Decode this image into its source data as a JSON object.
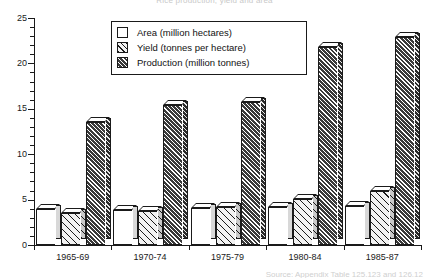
{
  "chart_data": {
    "type": "bar",
    "title": "Rice production, yield and area",
    "categories": [
      "1965-69",
      "1970-74",
      "1975-79",
      "1980-84",
      "1985-87"
    ],
    "series": [
      {
        "name": "Area (million hectares)",
        "values": [
          4.0,
          3.9,
          4.1,
          4.2,
          4.3
        ]
      },
      {
        "name": "Yield (tonnes per hectare)",
        "values": [
          3.5,
          3.8,
          4.2,
          5.1,
          5.9
        ]
      },
      {
        "name": "Production (million tonnes)",
        "values": [
          13.5,
          15.4,
          15.7,
          21.8,
          22.9
        ]
      }
    ],
    "xlabel": "",
    "ylabel": "",
    "ylim": [
      0,
      25
    ],
    "yticks": [
      0,
      5,
      10,
      15,
      20,
      25
    ],
    "yminor_step": 1,
    "grid": false,
    "legend_position": "top-center",
    "caption": "Source: Appendix Table 125.123 and 126.12"
  },
  "axis": {
    "y_labels": [
      "25",
      "20",
      "15",
      "10",
      "5",
      "0"
    ]
  },
  "legend": {
    "items": [
      {
        "label": "Area (million hectares)"
      },
      {
        "label": "Yield (tonnes per hectare)"
      },
      {
        "label": "Production (million tonnes)"
      }
    ]
  }
}
